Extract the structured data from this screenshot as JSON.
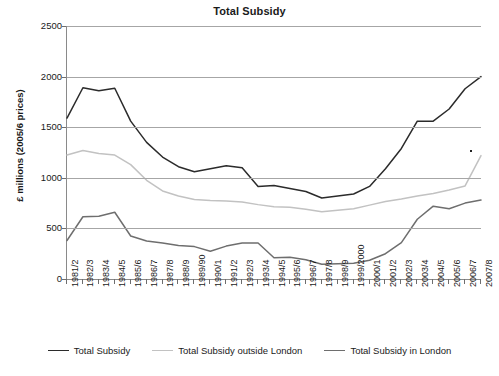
{
  "chart_data": {
    "type": "line",
    "title": "Total Subsidy",
    "xlabel": "",
    "ylabel": "£ millions (2005/6 prices)",
    "ylim": [
      0,
      2500
    ],
    "yticks": [
      0,
      500,
      1000,
      1500,
      2000,
      2500
    ],
    "grid": true,
    "legend_position": "bottom",
    "categories": [
      "1981/2",
      "1982/3",
      "1983/4",
      "1984/5",
      "1985/6",
      "1986/7",
      "1987/8",
      "1988/9",
      "1989/90",
      "1990/1",
      "1991/2",
      "1992/3",
      "1993/4",
      "1994/5",
      "1995/6",
      "1996/7",
      "1997/8",
      "1998/9",
      "1999/2000",
      "2000/1",
      "2001/2",
      "2002/3",
      "2003/4",
      "2004/5",
      "2005/6",
      "2006/7",
      "2007/8"
    ],
    "series": [
      {
        "name": "Total Subsidy",
        "color": "#2b2b2b",
        "values": [
          1590,
          1890,
          1860,
          1885,
          1560,
          1350,
          1205,
          1110,
          1060,
          1090,
          1120,
          1100,
          915,
          925,
          895,
          865,
          800,
          820,
          840,
          915,
          1090,
          1290,
          1560,
          1560,
          1680,
          1880,
          2000
        ]
      },
      {
        "name": "Total  Subsidy outside London",
        "color": "#c2c2c2",
        "values": [
          1225,
          1270,
          1240,
          1225,
          1130,
          975,
          870,
          820,
          785,
          775,
          770,
          760,
          735,
          715,
          710,
          690,
          665,
          680,
          695,
          730,
          765,
          790,
          820,
          845,
          880,
          920,
          1220
        ]
      },
      {
        "name": "Total  Subsidy in London",
        "color": "#6e6e6e",
        "values": [
          380,
          615,
          620,
          660,
          425,
          375,
          355,
          330,
          320,
          275,
          325,
          355,
          355,
          210,
          215,
          190,
          145,
          150,
          155,
          185,
          250,
          360,
          590,
          720,
          695,
          750,
          780
        ]
      }
    ],
    "annotations": [
      {
        "name": "speck-artifact",
        "x_px": 470,
        "y_px": 150
      }
    ]
  },
  "legend": {
    "items": [
      {
        "label": "Total Subsidy",
        "color": "#2b2b2b"
      },
      {
        "label": "Total  Subsidy outside London",
        "color": "#c2c2c2"
      },
      {
        "label": "Total  Subsidy in London",
        "color": "#6e6e6e"
      }
    ]
  }
}
